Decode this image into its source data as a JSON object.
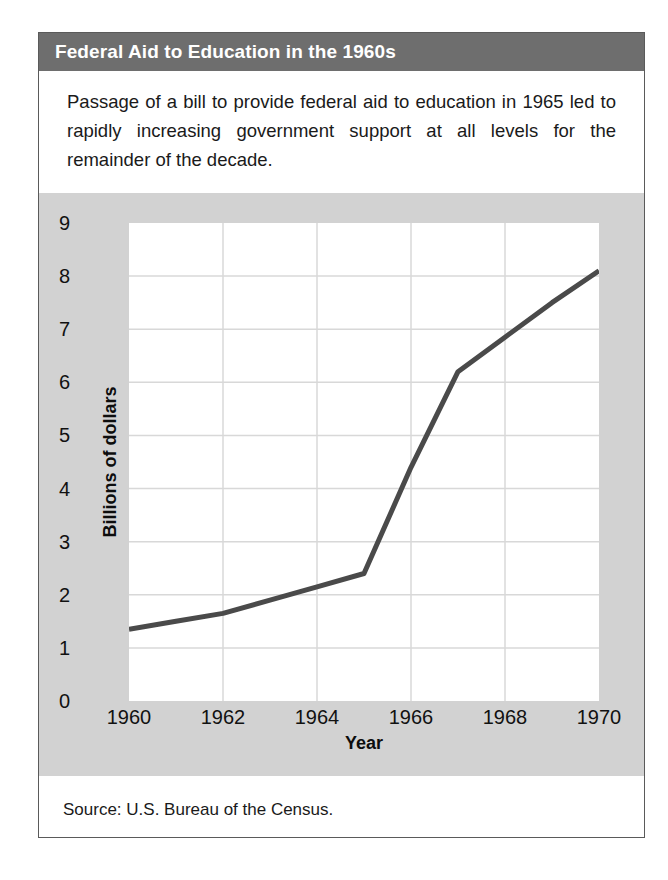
{
  "figure": {
    "title": "Federal Aid to Education in the 1960s",
    "description": "Passage of a bill to provide federal aid to education in 1965 led to rapidly increasing government support at all levels for the remainder of the decade.",
    "source": "Source: U.S. Bureau of the Census."
  },
  "colors": {
    "title_band": "#6e6e6e",
    "title_text": "#ffffff",
    "chart_panel": "#d2d2d2",
    "plot_background": "#ffffff",
    "line": "#4a4a4a",
    "grid": "#d8d8d8"
  },
  "chart_data": {
    "type": "line",
    "title": "Federal Aid to Education in the 1960s",
    "xlabel": "Year",
    "ylabel": "Billions of dollars",
    "xlim": [
      1960,
      1970
    ],
    "ylim": [
      0,
      9
    ],
    "grid": true,
    "legend": "none",
    "x_ticks": [
      "1960",
      "1962",
      "1964",
      "1966",
      "1968",
      "1970"
    ],
    "x_tick_values": [
      1960,
      1962,
      1964,
      1966,
      1968,
      1970
    ],
    "y_ticks": [
      "0",
      "1",
      "2",
      "3",
      "4",
      "5",
      "6",
      "7",
      "8",
      "9"
    ],
    "y_tick_values": [
      0,
      1,
      2,
      3,
      4,
      5,
      6,
      7,
      8,
      9
    ],
    "x": [
      1960,
      1961,
      1962,
      1963,
      1964,
      1965,
      1966,
      1967,
      1968,
      1969,
      1970
    ],
    "values": [
      1.35,
      1.5,
      1.65,
      1.9,
      2.15,
      2.4,
      4.4,
      6.2,
      6.85,
      7.5,
      8.1
    ],
    "series": [
      {
        "name": "Federal aid to education",
        "values": [
          1.35,
          1.5,
          1.65,
          1.9,
          2.15,
          2.4,
          4.4,
          6.2,
          6.85,
          7.5,
          8.1
        ]
      }
    ],
    "annotations": []
  }
}
